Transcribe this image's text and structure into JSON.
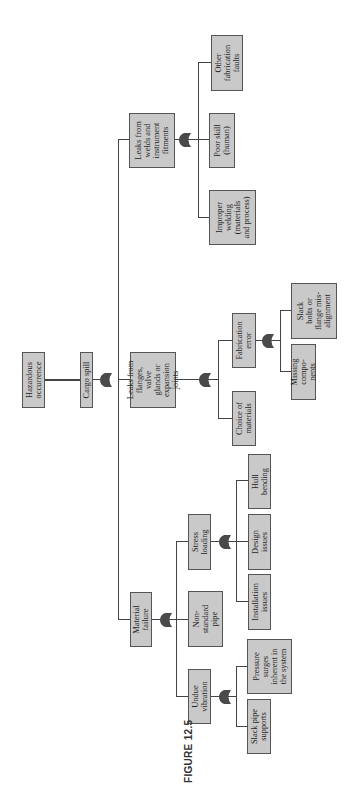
{
  "figure": {
    "label": "FIGURE 12.5"
  },
  "tree": {
    "top": "Hazardous occurrence",
    "level1": "Cargo spill",
    "branches": {
      "material_failure": {
        "label": "Material failure",
        "children": {
          "undue_vibration": {
            "label": "Undue vibration",
            "children": [
              "Slack pipe supports",
              "Pressure surges inherent in the system"
            ]
          },
          "non_standard_pipe": {
            "label": "Non-standard pipe"
          },
          "stress_loading": {
            "label": "Stress loading",
            "children": [
              "Installation issues",
              "Design issues",
              "Hull bending"
            ]
          }
        }
      },
      "leaks_flanges": {
        "label": "Leaks from flanges, valve glands or expansion joints",
        "children": {
          "choice_materials": {
            "label": "Choice of materials"
          },
          "fabrication_error": {
            "label": "Fabrication error",
            "children": [
              "Missing components",
              "Slack bolts or flange misalignment"
            ]
          }
        }
      },
      "leaks_welds": {
        "label": "Leaks from welds and instrument fitments",
        "children": [
          "Improper welding (materials and process)",
          "Poor skill (human)",
          "Other fabrication faults"
        ]
      }
    }
  },
  "display": {
    "hazardous": "Hazardous\noccurrence",
    "cargo": "Cargo spill",
    "material": "Material\nfailure",
    "flanges": "Leaks from\nflanges,\nvalve\nglands or\nexpansion\njoints",
    "welds": "Leaks from\nwelds and\ninstrument\nfitments",
    "vibration": "Undue\nvibration",
    "nonstd": "Non-\nstandard\npipe",
    "stress": "Stress\nloading",
    "slackpipe": "Slack pipe\nsupports",
    "pressure": "Pressure\nsurges\ninherent in\nthe system",
    "install": "Installation\nissues",
    "design": "Design\nissues",
    "hull": "Hull\nbending",
    "choice": "Choice of\nmaterials",
    "fab": "Fabrication\nerror",
    "missing": "Missing\ncompo-\nnents",
    "slackbolts": "Slack\nbolts or\nflange mis-\nalignment",
    "improper": "Improper\nwelding\n(materials\nand process)",
    "poorskill": "Poor skill\n(human)",
    "otherfab": "Other\nfabrication\nfaults"
  },
  "colors": {
    "box_fill": "#c9c9c9",
    "box_border": "#555555",
    "gate": "#4a4a4a",
    "line": "#444444"
  },
  "gates": {
    "type": "or-gate",
    "count": 6
  }
}
